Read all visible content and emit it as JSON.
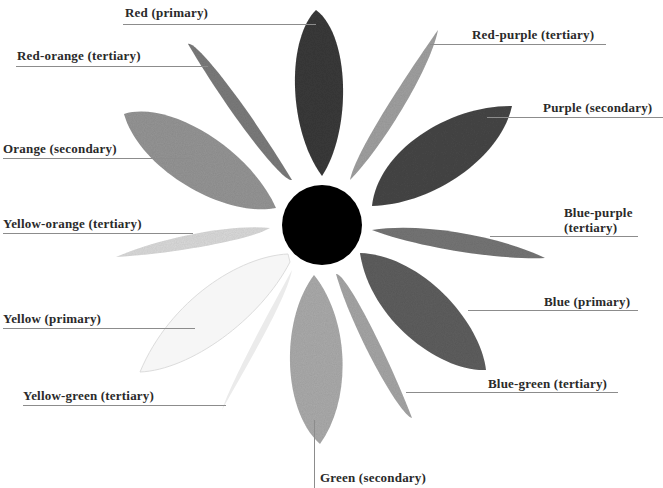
{
  "diagram": {
    "type": "color-wheel",
    "center": {
      "shape": "circle",
      "fill": "#000000"
    },
    "petals": [
      {
        "id": "red",
        "label": "Red (primary)",
        "category": "primary",
        "shade": "#3b3b3b"
      },
      {
        "id": "red-orange",
        "label": "Red-orange (tertiary)",
        "category": "tertiary",
        "shade": "#7c7c7c"
      },
      {
        "id": "orange",
        "label": "Orange (secondary)",
        "category": "secondary",
        "shade": "#959595"
      },
      {
        "id": "yellow-orange",
        "label": "Yellow-orange (tertiary)",
        "category": "tertiary",
        "shade": "#dadada"
      },
      {
        "id": "yellow",
        "label": "Yellow (primary)",
        "category": "primary",
        "shade": "#f4f4f4"
      },
      {
        "id": "yellow-green",
        "label": "Yellow-green (tertiary)",
        "category": "tertiary",
        "shade": "#ececec"
      },
      {
        "id": "green",
        "label": "Green (secondary)",
        "category": "secondary",
        "shade": "#ababab"
      },
      {
        "id": "blue-green",
        "label": "Blue-green (tertiary)",
        "category": "tertiary",
        "shade": "#a6a6a6"
      },
      {
        "id": "blue",
        "label": "Blue (primary)",
        "category": "primary",
        "shade": "#5e5e5e"
      },
      {
        "id": "blue-purple",
        "label_line1": "Blue-purple",
        "label_line2": "(tertiary)",
        "label": "Blue-purple (tertiary)",
        "category": "tertiary",
        "shade": "#767676"
      },
      {
        "id": "purple",
        "label": "Purple (secondary)",
        "category": "secondary",
        "shade": "#474747"
      },
      {
        "id": "red-purple",
        "label": "Red-purple (tertiary)",
        "category": "tertiary",
        "shade": "#a0a0a0"
      }
    ]
  }
}
